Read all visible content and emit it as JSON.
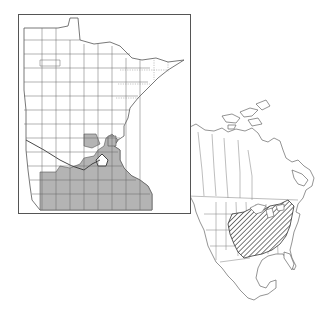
{
  "figure": {
    "type": "distribution-map",
    "background": "#ffffff",
    "line_color": "#555555",
    "panels": [
      {
        "id": "minnesota",
        "frame": {
          "x": 18,
          "y": 14,
          "width": 172,
          "height": 199
        },
        "occupied_fill": "#b4b4b4",
        "unoccupied_fill": "#ffffff",
        "legend": "shaded counties = recorded occurrence",
        "occupied_region": "southern and southeastern counties, extending north along the St. Croix / Twin Cities area"
      },
      {
        "id": "north-america",
        "hatch_color": "#333333",
        "hatched_region": "eastern United States: Midwest, Ohio Valley, Mid-Atlantic and Southeast interior",
        "legend": "hatched area = overall range"
      }
    ],
    "text_labels": []
  }
}
